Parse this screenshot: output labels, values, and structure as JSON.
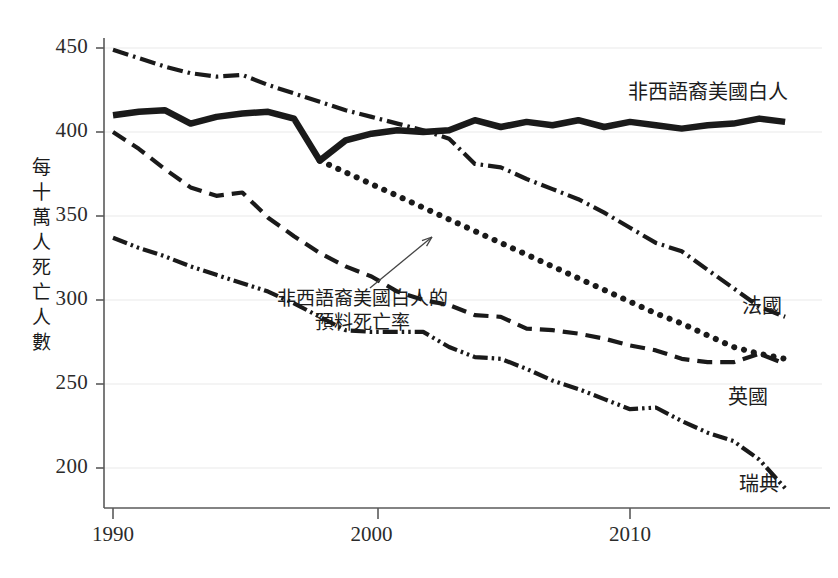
{
  "chart_data": {
    "type": "line",
    "title": "",
    "xlabel": "",
    "ylabel": "每十萬人死亡人數",
    "xlim": [
      1989.2,
      1916.0
    ],
    "ylim": [
      183,
      455
    ],
    "xticks": [
      1990,
      2000,
      2010
    ],
    "xtick_labels": [
      "1990",
      "2000",
      "2010"
    ],
    "yticks": [
      200,
      250,
      300,
      350,
      400,
      450
    ],
    "ytick_labels": [
      "200",
      "250",
      "300",
      "350",
      "400",
      "450"
    ],
    "grid": true,
    "legend_position": "inline-end-of-line",
    "x": [
      1990,
      1991,
      1992,
      1993,
      1994,
      1995,
      1996,
      1997,
      1998,
      1999,
      2000,
      2001,
      2002,
      2003,
      2004,
      2005,
      2006,
      2007,
      2008,
      2009,
      2010,
      2011,
      2012,
      2013,
      2014,
      2015,
      2016
    ],
    "series": [
      {
        "name": "非西語裔美國白人",
        "style": "solid-thick",
        "label_x": 628,
        "label_y": 76,
        "values": [
          410,
          412,
          413,
          405,
          409,
          411,
          412,
          408,
          383,
          395,
          399,
          401,
          400,
          401,
          407,
          403,
          406,
          404,
          407,
          403,
          406,
          404,
          402,
          404,
          405,
          408,
          406
        ]
      },
      {
        "name": "法國",
        "style": "dash-dot",
        "label_x": 742,
        "label_y": 290,
        "values": [
          449,
          444,
          439,
          435,
          433,
          434,
          428,
          423,
          418,
          413,
          409,
          405,
          401,
          396,
          381,
          379,
          372,
          366,
          360,
          352,
          343,
          334,
          329,
          318,
          307,
          296,
          290
        ]
      },
      {
        "name": "英國",
        "style": "dashed",
        "label_x": 728,
        "label_y": 381,
        "values": [
          400,
          390,
          378,
          367,
          362,
          364,
          349,
          338,
          328,
          320,
          314,
          305,
          300,
          297,
          291,
          290,
          283,
          282,
          280,
          277,
          273,
          270,
          265,
          263,
          263,
          268,
          262
        ]
      },
      {
        "name": "瑞典",
        "style": "dash-dot-dot",
        "label_x": 739,
        "label_y": 468,
        "values": [
          337,
          331,
          326,
          320,
          315,
          310,
          305,
          298,
          290,
          282,
          281,
          281,
          281,
          272,
          266,
          265,
          259,
          252,
          247,
          241,
          235,
          236,
          228,
          221,
          216,
          205,
          188
        ]
      },
      {
        "name": "非西語裔美國白人的預料死亡率",
        "style": "dotted-thick",
        "label_x": 0,
        "label_y": 0,
        "values": [
          null,
          null,
          null,
          null,
          null,
          null,
          null,
          null,
          383,
          376,
          369,
          362,
          355,
          348,
          341,
          334,
          327,
          320,
          313,
          306,
          299,
          292,
          286,
          279,
          272,
          268,
          265
        ]
      }
    ],
    "annotation": {
      "line1": "非西語裔美國白人的",
      "line2": "預料死亡率",
      "arrow_from": [
        370,
        288
      ],
      "arrow_to": [
        432,
        237
      ]
    }
  },
  "colors": {
    "line": "#1a1a1a",
    "axis": "#555555",
    "grid": "#e8e8e8",
    "text": "#2b2b2b",
    "background": "#ffffff"
  }
}
